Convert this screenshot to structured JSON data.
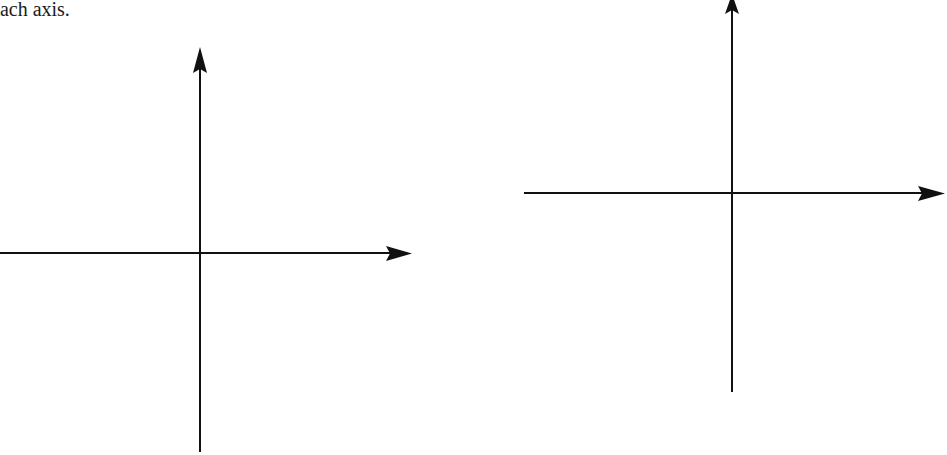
{
  "caption": {
    "text": "each axis."
  },
  "diagrams": [
    {
      "name": "left-axes",
      "origin": [
        200,
        253
      ],
      "x_axis": {
        "from": [
          0,
          253
        ],
        "to": [
          412,
          253
        ]
      },
      "y_axis": {
        "from": [
          200,
          452
        ],
        "to": [
          200,
          47
        ]
      }
    },
    {
      "name": "right-axes",
      "origin": [
        732,
        193
      ],
      "x_axis": {
        "from": [
          524,
          193
        ],
        "to": [
          945,
          193
        ]
      },
      "y_axis": {
        "from": [
          732,
          392
        ],
        "to": [
          732,
          -4
        ]
      }
    }
  ],
  "colors": {
    "ink": "#111111",
    "background": "#ffffff"
  }
}
